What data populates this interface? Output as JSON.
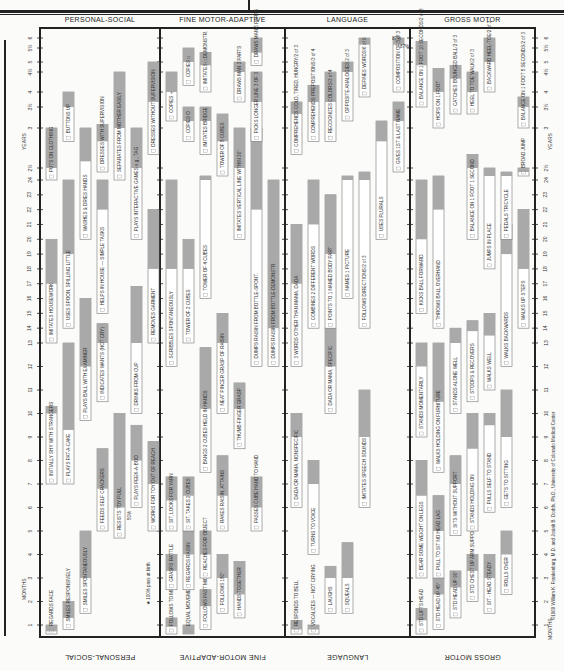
{
  "chart_data": {
    "type": "table",
    "sections": [
      "PERSONAL-SOCIAL",
      "FINE MOTOR-ADAPTIVE",
      "LANGUAGE",
      "GROSS MOTOR"
    ],
    "axis": {
      "unit_label_bottom": "MONTHS",
      "unit_label_top": "YEARS",
      "month_ticks": [
        "1",
        "2",
        "3",
        "4",
        "5",
        "6",
        "7",
        "8",
        "9",
        "10",
        "11",
        "12",
        "13",
        "14",
        "15",
        "16",
        "17",
        "18",
        "19",
        "20",
        "21",
        "22",
        "23",
        "24"
      ],
      "year_ticks": [
        "2½",
        "3",
        "3½",
        "4",
        "4½",
        "5",
        "5½",
        "6"
      ],
      "range_months": [
        0,
        72
      ]
    },
    "legend_note": "★ 100% pass at birth",
    "percent_note": "50%",
    "percent_87": "87%",
    "copyright": "©1969 William K. Frankenburg, M.D. and Josiah B. Dodds, Ph.D., University of Colorado Medical Center",
    "items": [
      {
        "section": 0,
        "lane": 0,
        "label": "REGARDS FACE",
        "start": 0,
        "shade": 0.3,
        "end": 1
      },
      {
        "section": 0,
        "lane": 1,
        "label": "SMILES RESPONSIVELY",
        "start": 0.5,
        "shade": 1.3,
        "end": 2
      },
      {
        "section": 0,
        "lane": 2,
        "label": "SMILES SPONTANEOUSLY",
        "start": 1.5,
        "shade": 3,
        "end": 5
      },
      {
        "section": 0,
        "lane": 0,
        "label": "INITIALLY SHY WITH STRANGERS",
        "start": 7,
        "shade": 10,
        "end": 10.3
      },
      {
        "section": 0,
        "lane": 1,
        "label": "PLAYS PAT-A-CAKE",
        "start": 7,
        "shade": 9.3,
        "end": 13
      },
      {
        "section": 0,
        "lane": 2,
        "label": "PLAYS BALL WITH EXAMINER",
        "start": 9.7,
        "shade": 12,
        "end": 16
      },
      {
        "section": 0,
        "lane": 3,
        "label": "FEEDS SELF CRACKERS",
        "start": 5,
        "shade": 6.8,
        "end": 8.5
      },
      {
        "section": 0,
        "lane": 3,
        "label": "INDICATES WANTS (NOT CRY)",
        "start": 10.5,
        "shade": 13,
        "end": 14.3
      },
      {
        "section": 0,
        "lane": 4,
        "label": "RESISTS TOY PULL",
        "start": 4.7,
        "shade": 6,
        "end": 10
      },
      {
        "section": 0,
        "lane": 5,
        "label": "PLAYS PEEK-A-BOO",
        "start": 6,
        "shade": 8,
        "end": 9.5
      },
      {
        "section": 0,
        "lane": 5,
        "label": "DRINKS FROM CUP",
        "start": 10,
        "shade": 13,
        "end": 16.8
      },
      {
        "section": 0,
        "lane": 6,
        "label": "WORKS FOR TOY OUT OF REACH",
        "start": 5,
        "shade": 7,
        "end": 8.8
      },
      {
        "section": 0,
        "lane": 0,
        "label": "IMITATES HOUSEWORK",
        "start": 13,
        "shade": 17,
        "end": 20
      },
      {
        "section": 0,
        "lane": 1,
        "label": "USES SPOON, SPILLING LITTLE",
        "start": 14,
        "shade": 19,
        "end": 24
      },
      {
        "section": 0,
        "lane": 0,
        "label": "PUTS ON CLOTHING",
        "start": 24,
        "shade": 30,
        "end": 36
      },
      {
        "section": 0,
        "lane": 1,
        "label": "BUTTONS UP",
        "start": 34,
        "shade": 42,
        "end": 48
      },
      {
        "section": 0,
        "lane": 2,
        "label": "WASHES & DRIES HANDS",
        "start": 20,
        "shade": 31,
        "end": 36
      },
      {
        "section": 0,
        "lane": 3,
        "label": "HELPS IN HOUSE — SIMPLE TASKS",
        "start": 15,
        "shade": 22,
        "end": 24
      },
      {
        "section": 0,
        "lane": 3,
        "label": "DRESSES WITH SUPERVISION",
        "start": 28,
        "shade": 34,
        "end": 37
      },
      {
        "section": 0,
        "lane": 4,
        "label": "SEPARATES FROM MOTHER EASILY",
        "start": 24,
        "shade": 36,
        "end": 54
      },
      {
        "section": 0,
        "lane": 5,
        "label": "PLAYS INTERACTIVE GAMES e.g., TAG",
        "start": 20,
        "shade": 30,
        "end": 36
      },
      {
        "section": 0,
        "lane": 6,
        "label": "REMOVES GARMENT",
        "start": 13,
        "shade": 18,
        "end": 22
      },
      {
        "section": 0,
        "lane": 6,
        "label": "DRESSES WITHOUT SUPERVISION",
        "start": 32,
        "shade": 44,
        "end": 60
      },
      {
        "section": 1,
        "lane": 0,
        "label": "FOLLOWS TO MIDLINE",
        "start": 0,
        "shade": 0.8,
        "end": 1.3
      },
      {
        "section": 1,
        "lane": 1,
        "label": "EQUAL MOVEMENTS",
        "start": 0,
        "shade": 0,
        "end": 1
      },
      {
        "section": 1,
        "lane": 2,
        "label": "FOLLOWS PAST MIDLINE",
        "start": 0.5,
        "shade": 1.8,
        "end": 2.5
      },
      {
        "section": 1,
        "lane": 3,
        "label": "FOLLOWS 180°",
        "start": 1.5,
        "shade": 3,
        "end": 4
      },
      {
        "section": 1,
        "lane": 4,
        "label": "HANDS TOGETHER",
        "start": 1.3,
        "shade": 2.3,
        "end": 3.7
      },
      {
        "section": 1,
        "lane": 0,
        "label": "GRASPS RATTLE",
        "start": 2.5,
        "shade": 3.3,
        "end": 4
      },
      {
        "section": 1,
        "lane": 1,
        "label": "REGARDS RAISIN",
        "start": 2.5,
        "shade": 4,
        "end": 5
      },
      {
        "section": 1,
        "lane": 2,
        "label": "REACHES FOR OBJECT",
        "start": 3,
        "shade": 4,
        "end": 5
      },
      {
        "section": 1,
        "lane": 0,
        "label": "SIT, LOOKS FOR YARN",
        "start": 5,
        "shade": 6.3,
        "end": 7.3
      },
      {
        "section": 1,
        "lane": 1,
        "label": "SIT, TAKES 2 CUBES",
        "start": 5,
        "shade": 6.5,
        "end": 7.3
      },
      {
        "section": 1,
        "lane": 2,
        "label": "BANGS 2 CUBES HELD IN HANDS",
        "start": 7.5,
        "shade": 10.2,
        "end": 12.8
      },
      {
        "section": 1,
        "lane": 3,
        "label": "RAKES RAISIN, ATTAINS",
        "start": 5,
        "shade": 6.5,
        "end": 8.2
      },
      {
        "section": 1,
        "lane": 3,
        "label": "NEAT PINCER GRASP OF RAISIN",
        "start": 10,
        "shade": 13,
        "end": 15
      },
      {
        "section": 1,
        "lane": 4,
        "label": "THUMB-FINGER GRASP",
        "start": 8.5,
        "shade": 10.2,
        "end": 11.3
      },
      {
        "section": 1,
        "lane": 5,
        "label": "PASSES CUBE HAND TO HAND",
        "start": 5,
        "shade": 6,
        "end": 7.3
      },
      {
        "section": 1,
        "lane": 0,
        "label": "SCRIBBLES SPONTANEOUSLY",
        "start": 12,
        "shade": 18,
        "end": 24
      },
      {
        "section": 1,
        "lane": 1,
        "label": "TOWER OF 2 CUBES",
        "start": 13,
        "shade": 18,
        "end": 20
      },
      {
        "section": 1,
        "lane": 2,
        "label": "TOWER OF 4 CUBES",
        "start": 16,
        "shade": 24,
        "end": 26
      },
      {
        "section": 1,
        "lane": 3,
        "label": "TOWER OF 8 CUBES",
        "start": 26,
        "shade": 34,
        "end": 40
      },
      {
        "section": 1,
        "lane": 4,
        "label": "IMITATES VERTICAL LINE WITHIN 30°",
        "start": 20,
        "shade": 30,
        "end": 36
      },
      {
        "section": 1,
        "lane": 5,
        "label": "DUMPS RAISIN FROM BOTTLE-SPONT.",
        "start": 12,
        "shade": 22,
        "end": 36
      },
      {
        "section": 1,
        "lane": 6,
        "label": "DUMPS RAISIN FROM BOTTLE-DEMONSTR.",
        "start": 12,
        "shade": 14,
        "end": 24
      },
      {
        "section": 1,
        "lane": 1,
        "label": "COPIES O",
        "start": 34,
        "shade": 38,
        "end": 42
      },
      {
        "section": 1,
        "lane": 0,
        "label": "COPIES +",
        "start": 38,
        "shade": 48,
        "end": 54
      },
      {
        "section": 1,
        "lane": 2,
        "label": "IMITATES BRIDGE",
        "start": 32,
        "shade": 38,
        "end": 42
      },
      {
        "section": 1,
        "lane": 1,
        "label": "COPIES □",
        "start": 50,
        "shade": 60,
        "end": 66
      },
      {
        "section": 1,
        "lane": 2,
        "label": "IMITATES □ DEMONSTR.",
        "start": 48,
        "shade": 58,
        "end": 64
      },
      {
        "section": 1,
        "lane": 4,
        "label": "DRAWS MAN 3 PARTS",
        "start": 44,
        "shade": 54,
        "end": 60
      },
      {
        "section": 1,
        "lane": 5,
        "label": "PICKS LONGER LINE 3 OF 3",
        "start": 34,
        "shade": 44,
        "end": 54
      },
      {
        "section": 1,
        "lane": 5,
        "label": "DRAWS MAN 6 PARTS",
        "start": 58,
        "shade": 64,
        "end": 72
      },
      {
        "section": 2,
        "lane": 0,
        "label": "RESPONDS TO BELL",
        "start": 0,
        "shade": 0.5,
        "end": 1.2
      },
      {
        "section": 2,
        "lane": 1,
        "label": "VOCALIZES — NOT CRYING",
        "start": 0,
        "shade": 0.5,
        "end": 1
      },
      {
        "section": 2,
        "lane": 2,
        "label": "LAUGHS",
        "start": 1.5,
        "shade": 3,
        "end": 3.5
      },
      {
        "section": 2,
        "lane": 3,
        "label": "SQUEALS",
        "start": 1.5,
        "shade": 3,
        "end": 4.5
      },
      {
        "section": 2,
        "lane": 1,
        "label": "TURNS TO VOICE",
        "start": 4,
        "shade": 7,
        "end": 8
      },
      {
        "section": 2,
        "lane": 0,
        "label": "DADA OR MAMA, NONSPECIFIC",
        "start": 6,
        "shade": 9,
        "end": 10
      },
      {
        "section": 2,
        "lane": 2,
        "label": "DADA OR MAMA, SPECIFIC",
        "start": 10,
        "shade": 12,
        "end": 14
      },
      {
        "section": 2,
        "lane": 4,
        "label": "IMITATES SPEECH SOUNDS",
        "start": 6,
        "shade": 9,
        "end": 11
      },
      {
        "section": 2,
        "lane": 0,
        "label": "3 WORDS OTHER THAN MAMA, DADA",
        "start": 12,
        "shade": 17,
        "end": 21
      },
      {
        "section": 2,
        "lane": 1,
        "label": "COMBINES 2 DIFFERENT WORDS",
        "start": 14,
        "shade": 21,
        "end": 24
      },
      {
        "section": 2,
        "lane": 2,
        "label": "POINTS TO 1 NAMED BODY PART",
        "start": 14,
        "shade": 19,
        "end": 23
      },
      {
        "section": 2,
        "lane": 3,
        "label": "NAMES 1 PICTURE",
        "start": 16,
        "shade": 24,
        "end": 26
      },
      {
        "section": 2,
        "lane": 4,
        "label": "FOLLOWS DIRECTIONS/2 of 3",
        "start": 14,
        "shade": 24,
        "end": 28
      },
      {
        "section": 2,
        "lane": 5,
        "label": "USES PLURALS",
        "start": 20,
        "shade": 34,
        "end": 38
      },
      {
        "section": 2,
        "lane": 6,
        "label": "GIVES 1ST & LAST NAME",
        "start": 28,
        "shade": 38,
        "end": 44
      },
      {
        "section": 2,
        "lane": 0,
        "label": "COMPREHENDS COLD, TIRED, HUNGRY/2 of 3",
        "start": 32,
        "shade": 40,
        "end": 44
      },
      {
        "section": 2,
        "lane": 1,
        "label": "COMPREHENDS PREPOSITIONS/3 of 4",
        "start": 34,
        "shade": 44,
        "end": 50
      },
      {
        "section": 2,
        "lane": 2,
        "label": "RECOGNIZES COLORS/3 of 4",
        "start": 34,
        "shade": 44,
        "end": 54
      },
      {
        "section": 2,
        "lane": 3,
        "label": "OPPOSITE ANALOGIES 2 of 3",
        "start": 38,
        "shade": 54,
        "end": 60
      },
      {
        "section": 2,
        "lane": 4,
        "label": "DEFINES WORDS/6 of 9",
        "start": 46,
        "shade": 68,
        "end": 72
      },
      {
        "section": 2,
        "lane": 6,
        "label": "COMPOSITION OF/3 of 3",
        "start": 48,
        "shade": 68,
        "end": 72
      },
      {
        "section": 3,
        "lane": 0,
        "label": "STD LIFTS HEAD",
        "start": 0,
        "shade": 1.2,
        "end": 1.7
      },
      {
        "section": 3,
        "lane": 1,
        "label": "STD HEAD UP 45°",
        "start": 0.5,
        "shade": 2.3,
        "end": 3
      },
      {
        "section": 3,
        "lane": 2,
        "label": "STD HEAD UP 90°",
        "start": 1.3,
        "shade": 2.6,
        "end": 3.3
      },
      {
        "section": 3,
        "lane": 3,
        "label": "STD CHEST UP ARM SUPPORT",
        "start": 2,
        "shade": 3.3,
        "end": 4
      },
      {
        "section": 3,
        "lane": 4,
        "label": "SIT - HEAD STEADY",
        "start": 1.5,
        "shade": 3,
        "end": 4
      },
      {
        "section": 3,
        "lane": 5,
        "label": "ROLLS OVER",
        "start": 2.3,
        "shade": 4,
        "end": 5
      },
      {
        "section": 3,
        "lane": 0,
        "label": "BEAR SOME WEIGHT ON LEGS",
        "start": 3,
        "shade": 6.5,
        "end": 8
      },
      {
        "section": 3,
        "lane": 1,
        "label": "PULL TO SIT NO HEAD LAG",
        "start": 3,
        "shade": 5,
        "end": 6.5
      },
      {
        "section": 3,
        "lane": 2,
        "label": "SITS WITHOUT SUPPORT",
        "start": 4.8,
        "shade": 7,
        "end": 8.2
      },
      {
        "section": 3,
        "lane": 3,
        "label": "STANDS HOLDING ON",
        "start": 5,
        "shade": 8.5,
        "end": 10
      },
      {
        "section": 3,
        "lane": 4,
        "label": "PULLS SELF TO STAND",
        "start": 5.8,
        "shade": 9.5,
        "end": 10
      },
      {
        "section": 3,
        "lane": 5,
        "label": "GETS TO SITTING",
        "start": 6,
        "shade": 9,
        "end": 11
      },
      {
        "section": 3,
        "lane": 0,
        "label": "STANDS MOMENTARILY",
        "start": 9,
        "shade": 12,
        "end": 13
      },
      {
        "section": 3,
        "lane": 1,
        "label": "WALKS HOLDING ON FURNITURE",
        "start": 7.5,
        "shade": 10.5,
        "end": 13
      },
      {
        "section": 3,
        "lane": 2,
        "label": "STANDS ALONE WELL",
        "start": 10,
        "shade": 13,
        "end": 14
      },
      {
        "section": 3,
        "lane": 3,
        "label": "STOOPS & RECOVERS",
        "start": 10.5,
        "shade": 13.8,
        "end": 14.5
      },
      {
        "section": 3,
        "lane": 4,
        "label": "WALKS WELL",
        "start": 11,
        "shade": 13.5,
        "end": 15
      },
      {
        "section": 3,
        "lane": 5,
        "label": "WALKS BACKWARDS",
        "start": 12,
        "shade": 19,
        "end": 21
      },
      {
        "section": 3,
        "lane": 0,
        "label": "KICKS BALL FORWARD",
        "start": 15,
        "shade": 20,
        "end": 24
      },
      {
        "section": 3,
        "lane": 1,
        "label": "THROWS BALL OVERHAND",
        "start": 14,
        "shade": 22,
        "end": 26
      },
      {
        "section": 3,
        "lane": 3,
        "label": "BALANCE ON 1 FOOT 1 SECOND",
        "start": 20,
        "shade": 30,
        "end": 32
      },
      {
        "section": 3,
        "lane": 4,
        "label": "JUMPS IN PLACE",
        "start": 18,
        "shade": 26,
        "end": 30
      },
      {
        "section": 3,
        "lane": 5,
        "label": "PEDALS TRICYCLE",
        "start": 20,
        "shade": 26,
        "end": 28
      },
      {
        "section": 3,
        "lane": 6,
        "label": "BROAD JUMP",
        "start": 26,
        "shade": 28,
        "end": 30
      },
      {
        "section": 3,
        "lane": 6,
        "label": "WALKS UP STEPS",
        "start": 14,
        "shade": 18,
        "end": 22
      },
      {
        "section": 3,
        "lane": 0,
        "label": "BALANCE ON 1 FOOT 10 SECONDS/2 of 3",
        "start": 42,
        "shade": 58,
        "end": 70
      },
      {
        "section": 3,
        "lane": 1,
        "label": "HOPS ON 1 FOOT",
        "start": 36,
        "shade": 48,
        "end": 56
      },
      {
        "section": 3,
        "lane": 2,
        "label": "CATCHES BOUNCED BALL/2 of 3",
        "start": 40,
        "shade": 52,
        "end": 58
      },
      {
        "section": 3,
        "lane": 3,
        "label": "HEEL TO TOE WALK/2 of 3",
        "start": 40,
        "shade": 48,
        "end": 54
      },
      {
        "section": 3,
        "lane": 4,
        "label": "BACKWARD HEEL-TOE/2 of 3",
        "start": 48,
        "shade": 60,
        "end": 72
      },
      {
        "section": 3,
        "lane": 6,
        "label": "BALANCE ON 1 FOOT 5 SECONDS/2 of 3",
        "start": 36,
        "shade": 42,
        "end": 46
      }
    ]
  }
}
